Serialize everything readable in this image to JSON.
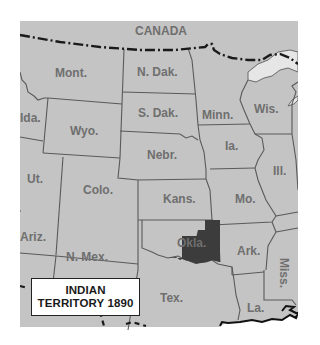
{
  "map": {
    "title": "INDIAN TERRITORY 1890",
    "colors": {
      "land": "#c4c4c4",
      "water": "#e6e6e6",
      "border": "#5a5a5a",
      "highlight": "#3c3c3c",
      "label": "#6f6f6f",
      "background": "#ffffff"
    },
    "country_label": "CANADA",
    "states": [
      {
        "id": "mont",
        "label": "Mont."
      },
      {
        "id": "ndak",
        "label": "N. Dak."
      },
      {
        "id": "sdak",
        "label": "S. Dak."
      },
      {
        "id": "minn",
        "label": "Minn."
      },
      {
        "id": "wis",
        "label": "Wis."
      },
      {
        "id": "ida",
        "label": "Ida."
      },
      {
        "id": "wyo",
        "label": "Wyo."
      },
      {
        "id": "nebr",
        "label": "Nebr."
      },
      {
        "id": "ia",
        "label": "Ia."
      },
      {
        "id": "ill",
        "label": "Ill."
      },
      {
        "id": "ut",
        "label": "Ut."
      },
      {
        "id": "colo",
        "label": "Colo."
      },
      {
        "id": "kans",
        "label": "Kans."
      },
      {
        "id": "mo",
        "label": "Mo."
      },
      {
        "id": "ariz",
        "label": "Ariz."
      },
      {
        "id": "nmex",
        "label": "N. Mex."
      },
      {
        "id": "okla",
        "label": "Okla."
      },
      {
        "id": "ark",
        "label": "Ark."
      },
      {
        "id": "miss",
        "label": "Miss."
      },
      {
        "id": "tex",
        "label": "Tex."
      },
      {
        "id": "la",
        "label": "La."
      }
    ],
    "legend": {
      "line1": "INDIAN",
      "line2": "TERRITORY 1890"
    }
  }
}
